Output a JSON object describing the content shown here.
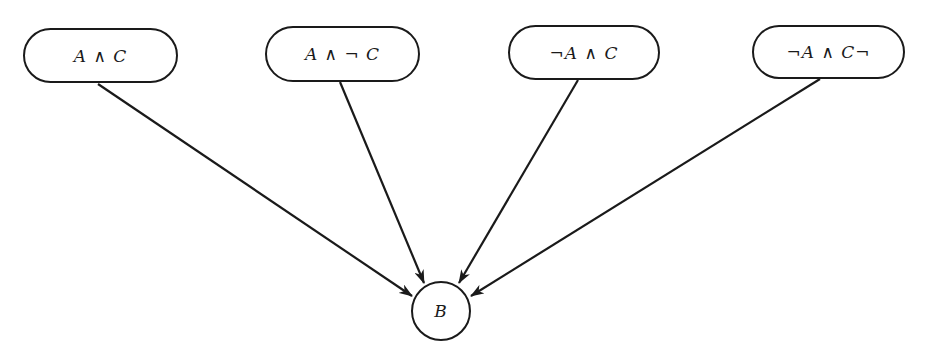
{
  "diagram": {
    "type": "directed-graph",
    "nodes": [
      {
        "id": "n1",
        "label": "A ∧ C",
        "shape": "rounded-rect",
        "x": 23,
        "y": 28,
        "w": 155,
        "h": 55
      },
      {
        "id": "n2",
        "label": "A ∧ ¬ C",
        "shape": "rounded-rect",
        "x": 265,
        "y": 26,
        "w": 155,
        "h": 56
      },
      {
        "id": "n3",
        "label": "¬A ∧ C",
        "shape": "rounded-rect",
        "x": 508,
        "y": 25,
        "w": 152,
        "h": 55
      },
      {
        "id": "n4",
        "label": "¬A ∧ C¬",
        "shape": "rounded-rect",
        "x": 752,
        "y": 25,
        "w": 153,
        "h": 54
      },
      {
        "id": "b",
        "label": "B",
        "shape": "circle",
        "cx": 441,
        "cy": 311,
        "r": 30
      }
    ],
    "edges": [
      {
        "from": "n1",
        "to": "b",
        "x1": 98,
        "y1": 84,
        "x2": 412,
        "y2": 296
      },
      {
        "from": "n2",
        "to": "b",
        "x1": 340,
        "y1": 82,
        "x2": 424,
        "y2": 283
      },
      {
        "from": "n3",
        "to": "b",
        "x1": 578,
        "y1": 80,
        "x2": 459,
        "y2": 283
      },
      {
        "from": "n4",
        "to": "b",
        "x1": 820,
        "y1": 79,
        "x2": 471,
        "y2": 296
      }
    ],
    "colors": {
      "stroke": "#1a1a1a",
      "background": "#ffffff"
    }
  }
}
